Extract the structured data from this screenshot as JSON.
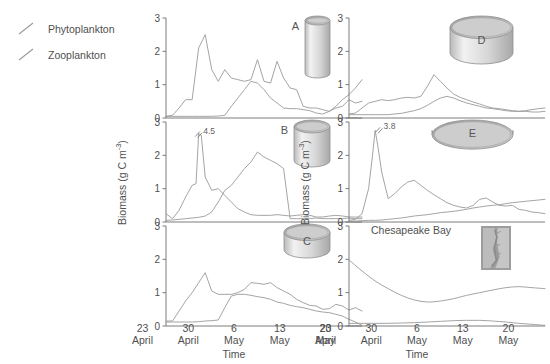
{
  "legend": {
    "items": [
      {
        "label": "Phytoplankton",
        "key": "phyto",
        "color": "#8c8c8c"
      },
      {
        "label": "Zooplankton",
        "key": "zoo",
        "color": "#8c8c8c"
      }
    ]
  },
  "axes": {
    "ylabel": "Biomass (g C m",
    "ylabel_exp": "-3",
    "ylabel_close": ")",
    "ylabel_full": "Biomass (g C m-3)",
    "xlabel": "Time",
    "yticks": [
      "0",
      "1",
      "2",
      "3"
    ],
    "ylim": [
      0,
      3
    ],
    "xticks": [
      {
        "day": "23",
        "month": "April"
      },
      {
        "day": "30",
        "month": "April"
      },
      {
        "day": "6",
        "month": "May"
      },
      {
        "day": "13",
        "month": "May"
      },
      {
        "day": "20",
        "month": "May"
      }
    ]
  },
  "chart_data": {
    "type": "line",
    "title": "",
    "xlabel": "Time",
    "ylabel": "Biomass (g C m-3)",
    "ylim": [
      0,
      3
    ],
    "xlim": [
      0,
      30
    ],
    "x_tick_values": [
      1,
      8,
      15,
      22,
      29
    ],
    "x_tick_labels": [
      "23 April",
      "30 April",
      "6 May",
      "13 May",
      "20 May"
    ],
    "grid": false,
    "legend_position": "top-left",
    "series_names": [
      "Phytoplankton",
      "Zooplankton"
    ],
    "panels": [
      {
        "id": "A",
        "letter": "A",
        "column": "left",
        "row": 0,
        "container": {
          "shape": "cylinder",
          "width_ratio": 0.18,
          "height_ratio": 1.0
        },
        "annotation": null,
        "series": [
          {
            "name": "Phytoplankton",
            "x": [
              0,
              1,
              2,
              3,
              4,
              5,
              6,
              7,
              8,
              9,
              10,
              11,
              12,
              13,
              14,
              15,
              16,
              17,
              18,
              19,
              20,
              21,
              22,
              23,
              24,
              25,
              26,
              27,
              28,
              29,
              30
            ],
            "values": [
              0.05,
              0.08,
              0.3,
              0.55,
              0.55,
              2.1,
              2.5,
              1.45,
              1.1,
              1.45,
              1.2,
              1.15,
              1.1,
              1.15,
              1.75,
              1.1,
              1.05,
              1.7,
              1.2,
              0.9,
              0.85,
              0.35,
              0.3,
              0.3,
              0.25,
              0.2,
              0.3,
              0.35,
              0.55,
              0.45,
              0.5
            ]
          },
          {
            "name": "Zooplankton",
            "x": [
              0,
              1,
              2,
              3,
              4,
              5,
              6,
              7,
              8,
              9,
              10,
              11,
              12,
              13,
              14,
              15,
              16,
              17,
              18,
              19,
              20,
              21,
              22,
              23,
              24,
              25,
              26,
              27,
              28,
              29,
              30
            ],
            "values": [
              0.05,
              0.05,
              0.05,
              0.05,
              0.05,
              0.05,
              0.05,
              0.05,
              0.06,
              0.08,
              0.35,
              0.6,
              0.85,
              1.1,
              1.05,
              0.85,
              0.6,
              0.45,
              0.3,
              0.28,
              0.28,
              0.25,
              0.22,
              0.15,
              0.12,
              0.2,
              0.35,
              0.55,
              0.7,
              0.9,
              1.15
            ]
          }
        ]
      },
      {
        "id": "B",
        "letter": "B",
        "column": "left",
        "row": 1,
        "container": {
          "shape": "cylinder",
          "width_ratio": 0.3,
          "height_ratio": 0.75
        },
        "annotation": {
          "text": "4.5",
          "x": 5,
          "y": 2.62
        },
        "series": [
          {
            "name": "Phytoplankton",
            "x": [
              0,
              1,
              2,
              3,
              4,
              4.6,
              5,
              5.4,
              6,
              7,
              8,
              9,
              10,
              11,
              12,
              13,
              14,
              15,
              16,
              17,
              18,
              19,
              20,
              21,
              22,
              23,
              24,
              25,
              26,
              27,
              28,
              29,
              30
            ],
            "values": [
              0.25,
              0.1,
              0.35,
              0.75,
              1.1,
              1.15,
              2.65,
              2.6,
              1.35,
              0.95,
              1.0,
              0.8,
              0.6,
              0.4,
              0.3,
              0.22,
              0.2,
              0.2,
              0.2,
              0.22,
              0.2,
              0.18,
              0.2,
              0.22,
              0.2,
              0.15,
              0.15,
              0.18,
              0.2,
              0.18,
              0.15,
              0.15,
              0.15
            ]
          },
          {
            "name": "Zooplankton",
            "x": [
              0,
              1,
              2,
              3,
              4,
              5,
              6,
              7,
              8,
              9,
              10,
              11,
              12,
              13,
              14,
              15,
              16,
              17,
              18,
              19,
              20,
              21,
              22,
              23,
              24,
              25,
              26,
              27,
              28,
              29,
              30
            ],
            "values": [
              0.05,
              0.06,
              0.08,
              0.1,
              0.12,
              0.14,
              0.18,
              0.3,
              0.6,
              0.95,
              1.1,
              1.35,
              1.6,
              1.8,
              2.1,
              1.95,
              1.85,
              1.75,
              1.6,
              0.1,
              0.1,
              0.1,
              0.1,
              0.12,
              0.1,
              0.1,
              0.1,
              0.1,
              0.12,
              0.1,
              0.1
            ]
          }
        ]
      },
      {
        "id": "C",
        "letter": "C",
        "column": "left",
        "row": 2,
        "container": {
          "shape": "cylinder",
          "width_ratio": 0.42,
          "height_ratio": 0.55
        },
        "annotation": null,
        "series": [
          {
            "name": "Phytoplankton",
            "x": [
              0,
              1,
              2,
              3,
              4,
              5,
              6,
              7,
              8,
              9,
              10,
              11,
              12,
              13,
              14,
              15,
              16,
              17,
              18,
              19,
              20,
              21,
              22,
              23,
              24,
              25,
              26,
              27,
              28,
              29,
              30
            ],
            "values": [
              0.15,
              0.15,
              0.45,
              0.75,
              1.0,
              1.3,
              1.6,
              1.05,
              0.95,
              0.95,
              0.95,
              1.0,
              1.1,
              1.3,
              1.28,
              1.25,
              1.3,
              1.15,
              1.05,
              0.95,
              0.8,
              0.7,
              0.62,
              0.6,
              0.5,
              0.52,
              0.65,
              0.6,
              0.48,
              0.55,
              0.45
            ]
          },
          {
            "name": "Zooplankton",
            "x": [
              0,
              1,
              2,
              3,
              4,
              5,
              6,
              7,
              8,
              9,
              10,
              11,
              12,
              13,
              14,
              15,
              16,
              17,
              18,
              19,
              20,
              21,
              22,
              23,
              24,
              25,
              26,
              27,
              28,
              29,
              30
            ],
            "values": [
              0.12,
              0.12,
              0.12,
              0.12,
              0.12,
              0.13,
              0.15,
              0.16,
              0.18,
              0.55,
              0.9,
              0.95,
              0.95,
              0.92,
              0.88,
              0.85,
              0.8,
              0.72,
              0.68,
              0.62,
              0.58,
              0.55,
              0.5,
              0.45,
              0.42,
              0.4,
              0.35,
              0.3,
              0.2,
              0.12,
              0.02
            ]
          }
        ]
      },
      {
        "id": "D",
        "letter": "D",
        "column": "right",
        "row": 0,
        "container": {
          "shape": "cylinder",
          "width_ratio": 0.62,
          "height_ratio": 0.78
        },
        "annotation": null,
        "series": [
          {
            "name": "Phytoplankton",
            "x": [
              0,
              1,
              2,
              3,
              4,
              5,
              6,
              7,
              8,
              9,
              10,
              11,
              12,
              13,
              14,
              15,
              16,
              17,
              18,
              19,
              20,
              21,
              22,
              23,
              24,
              25,
              26,
              27,
              28,
              29,
              30
            ],
            "values": [
              0.12,
              0.15,
              0.3,
              0.45,
              0.5,
              0.55,
              0.52,
              0.55,
              0.6,
              0.62,
              0.6,
              0.65,
              0.95,
              1.3,
              1.1,
              0.9,
              0.72,
              0.62,
              0.55,
              0.48,
              0.42,
              0.35,
              0.3,
              0.28,
              0.25,
              0.22,
              0.2,
              0.2,
              0.18,
              0.18,
              0.2
            ]
          },
          {
            "name": "Zooplankton",
            "x": [
              0,
              1,
              2,
              3,
              4,
              5,
              6,
              7,
              8,
              9,
              10,
              11,
              12,
              13,
              14,
              15,
              16,
              17,
              18,
              19,
              20,
              21,
              22,
              23,
              24,
              25,
              26,
              27,
              28,
              29,
              30
            ],
            "values": [
              0.1,
              0.1,
              0.1,
              0.1,
              0.1,
              0.1,
              0.1,
              0.12,
              0.14,
              0.18,
              0.22,
              0.28,
              0.38,
              0.5,
              0.6,
              0.65,
              0.6,
              0.52,
              0.45,
              0.4,
              0.35,
              0.3,
              0.28,
              0.25,
              0.22,
              0.2,
              0.2,
              0.22,
              0.25,
              0.28,
              0.3
            ]
          }
        ]
      },
      {
        "id": "E",
        "letter": "E",
        "column": "right",
        "row": 1,
        "container": {
          "shape": "cylinder",
          "width_ratio": 0.82,
          "height_ratio": 0.4
        },
        "annotation": {
          "text": "3.8",
          "x": 4.6,
          "y": 2.75
        },
        "series": [
          {
            "name": "Phytoplankton",
            "x": [
              0,
              1,
              2,
              3,
              3.6,
              4,
              4.4,
              5,
              6,
              7,
              8,
              9,
              10,
              11,
              12,
              13,
              14,
              15,
              16,
              17,
              18,
              19,
              20,
              21,
              22,
              23,
              24,
              25,
              26,
              27,
              28,
              29,
              30
            ],
            "values": [
              0.05,
              0.08,
              0.25,
              1.0,
              2.0,
              2.75,
              2.3,
              1.5,
              0.7,
              0.85,
              1.05,
              1.2,
              1.25,
              1.1,
              0.95,
              0.82,
              0.7,
              0.58,
              0.5,
              0.45,
              0.42,
              0.5,
              0.68,
              0.72,
              0.6,
              0.5,
              0.48,
              0.5,
              0.38,
              0.35,
              0.3,
              0.28,
              0.25
            ]
          },
          {
            "name": "Zooplankton",
            "x": [
              0,
              1,
              2,
              3,
              4,
              5,
              6,
              7,
              8,
              9,
              10,
              11,
              12,
              13,
              14,
              15,
              16,
              17,
              18,
              19,
              20,
              21,
              22,
              23,
              24,
              25,
              26,
              27,
              28,
              29,
              30
            ],
            "values": [
              0.03,
              0.03,
              0.04,
              0.05,
              0.05,
              0.06,
              0.08,
              0.1,
              0.12,
              0.15,
              0.18,
              0.2,
              0.22,
              0.25,
              0.28,
              0.3,
              0.32,
              0.35,
              0.38,
              0.42,
              0.45,
              0.48,
              0.5,
              0.52,
              0.55,
              0.58,
              0.6,
              0.62,
              0.64,
              0.66,
              0.68
            ]
          }
        ]
      },
      {
        "id": "F",
        "letter": "",
        "column": "right",
        "row": 2,
        "site": "Chesapeake Bay",
        "container": {
          "shape": "map"
        },
        "annotation": null,
        "series": [
          {
            "name": "Phytoplankton",
            "x": [
              0,
              2,
              4,
              6,
              8,
              10,
              12,
              14,
              16,
              18,
              20,
              22,
              24,
              26,
              28,
              30
            ],
            "values": [
              1.98,
              1.65,
              1.35,
              1.12,
              0.92,
              0.78,
              0.72,
              0.75,
              0.82,
              0.92,
              1.0,
              1.08,
              1.15,
              1.18,
              1.15,
              1.12
            ]
          },
          {
            "name": "Zooplankton",
            "x": [
              0,
              2,
              4,
              6,
              8,
              10,
              12,
              14,
              16,
              18,
              20,
              22,
              24,
              26,
              28,
              30
            ],
            "values": [
              0.08,
              0.08,
              0.08,
              0.08,
              0.09,
              0.1,
              0.12,
              0.14,
              0.16,
              0.17,
              0.17,
              0.15,
              0.12,
              0.08,
              0.05,
              0.02
            ]
          }
        ]
      }
    ]
  }
}
